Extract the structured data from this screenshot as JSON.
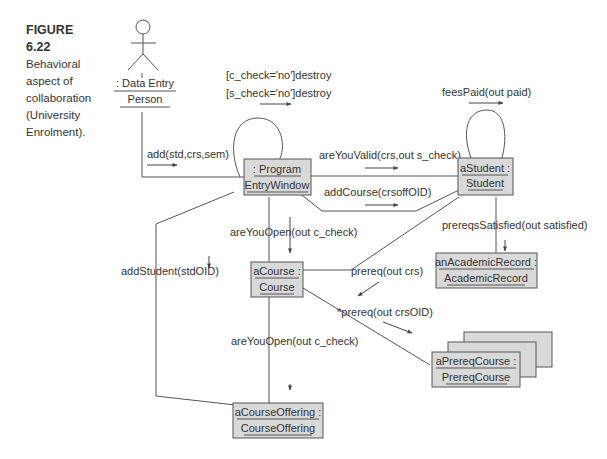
{
  "caption": {
    "figure": "FIGURE 6.22",
    "text": "Behavioral aspect of collaboration (University Enrolment)."
  },
  "actor": {
    "line1": ": Data Entry",
    "line2": "Person"
  },
  "objects": {
    "program": {
      "line1": ": Program",
      "line2": "EntryWindow"
    },
    "student": {
      "line1": "aStudent :",
      "line2": "Student"
    },
    "record": {
      "line1": "anAcademicRecord :",
      "line2": "AcademicRecord"
    },
    "course": {
      "line1": "aCourse :",
      "line2": "Course"
    },
    "prereq": {
      "line1": "aPrereqCourse :",
      "line2": "PrereqCourse"
    },
    "offering": {
      "line1": "aCourseOffering :",
      "line2": "CourseOffering"
    }
  },
  "messages": {
    "c_destroy": "[c_check='no']destroy",
    "s_destroy": "[s_check='no']destroy",
    "fees": "feesPaid(out paid)",
    "add": "add(std,crs,sem)",
    "valid": "areYouValid(crs,out s_check)",
    "addcourse": "addCourse(crsoffOID)",
    "open1": "areYouOpen(out c_check)",
    "satisfied": "prereqsSatisfied(out satisfied)",
    "addstudent": "addStudent(stdOID)",
    "prereq": "prereq(out crs)",
    "prereq_star": "*prereq(out crsOID)",
    "open2": "areYouOpen(out c_check)"
  },
  "colors": {
    "box_fill": "#d9d9d9",
    "stroke": "#555555"
  }
}
